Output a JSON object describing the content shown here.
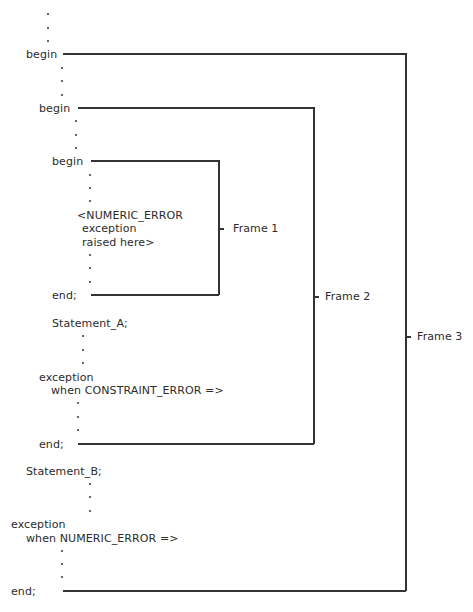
{
  "diagram": {
    "code": {
      "outer_begin": "begin",
      "middle_begin": "begin",
      "inner_begin": "begin",
      "raise_note_line1": "<NUMERIC_ERROR",
      "raise_note_line2": "exception",
      "raise_note_line3": "raised here>",
      "inner_end": "end;",
      "statement_a": "Statement_A;",
      "middle_exception": "exception",
      "middle_handler": "when CONSTRAINT_ERROR =>",
      "middle_end": "end;",
      "statement_b": "Statement_B;",
      "outer_exception": "exception",
      "outer_handler": "when NUMERIC_ERROR =>",
      "outer_end": "end;"
    },
    "frames": [
      {
        "label": "Frame 1"
      },
      {
        "label": "Frame 2"
      },
      {
        "label": "Frame 3"
      }
    ],
    "line_color": "#333333"
  }
}
